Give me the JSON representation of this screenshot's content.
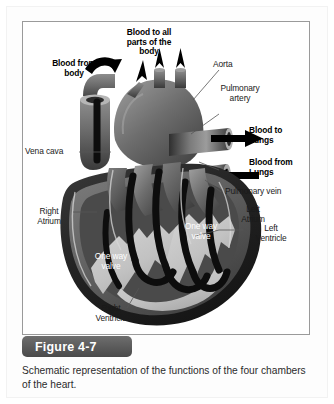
{
  "figure": {
    "number_label": "Figure 4-7",
    "caption": "Schematic representation of the functions of the four chambers of the heart.",
    "title": "Schematic representation of the functions of the four chambers of the heart."
  },
  "diagram": {
    "style": "grayscale shaded anatomical illustration",
    "colors": {
      "background": "#ffffff",
      "border": "#9a9a9a",
      "badge_fill": "#5a5a5a",
      "badge_text": "#ffffff",
      "caption_text": "#2b2b2b",
      "label_text": "#1a1a1a",
      "label_text_inverse": "#ffffff",
      "leader_line": "#555555",
      "heart_dark": "#3a3a3a",
      "heart_mid": "#6b6b6b",
      "heart_light": "#b9b9b9",
      "chamber_fill": "#c9c9c9",
      "flow_channel": "#0d0d0d",
      "arrow": "#000000"
    },
    "labels": [
      {
        "id": "blood-to-all-parts",
        "text": "Blood to all\nparts of the\nbody",
        "bold": true,
        "align": "center",
        "color": "dark"
      },
      {
        "id": "aorta",
        "text": "Aorta",
        "bold": false,
        "align": "left",
        "color": "dark"
      },
      {
        "id": "pulmonary-artery",
        "text": "Pulmonary\nartery",
        "bold": false,
        "align": "center",
        "color": "dark"
      },
      {
        "id": "blood-from-body",
        "text": "Blood from\nbody",
        "bold": true,
        "align": "center",
        "color": "dark"
      },
      {
        "id": "blood-to-lungs",
        "text": "Blood to\nLungs",
        "bold": true,
        "align": "left",
        "color": "dark"
      },
      {
        "id": "blood-from-lungs",
        "text": "Blood from\nLungs",
        "bold": true,
        "align": "left",
        "color": "dark"
      },
      {
        "id": "vena-cava",
        "text": "Vena cava",
        "bold": false,
        "align": "left",
        "color": "dark"
      },
      {
        "id": "pulmonary-vein",
        "text": "Pulmonary vein",
        "bold": false,
        "align": "left",
        "color": "dark"
      },
      {
        "id": "left-atrium",
        "text": "Left\nAtrium",
        "bold": false,
        "align": "center",
        "color": "dark"
      },
      {
        "id": "right-atrium",
        "text": "Right\nAtrium",
        "bold": false,
        "align": "center",
        "color": "dark"
      },
      {
        "id": "left-ventricle",
        "text": "Left\nVentricle",
        "bold": false,
        "align": "center",
        "color": "dark"
      },
      {
        "id": "right-ventricle",
        "text": "Right\nVentricle",
        "bold": false,
        "align": "center",
        "color": "dark"
      },
      {
        "id": "one-way-valve-upper",
        "text": "One way\nvalve",
        "bold": false,
        "align": "center",
        "color": "white"
      },
      {
        "id": "one-way-valve-lower",
        "text": "One way\nvalve",
        "bold": false,
        "align": "center",
        "color": "white"
      }
    ],
    "flow_arrows": [
      {
        "id": "arrow-to-body-1",
        "direction": "up",
        "meaning": "blood out to body"
      },
      {
        "id": "arrow-to-body-2",
        "direction": "up",
        "meaning": "blood out to body"
      },
      {
        "id": "arrow-to-body-3",
        "direction": "up",
        "meaning": "blood out to body"
      },
      {
        "id": "arrow-from-body",
        "direction": "down",
        "meaning": "blood in from body via vena cava"
      },
      {
        "id": "arrow-to-lungs",
        "direction": "right",
        "meaning": "blood out to lungs via pulmonary artery"
      },
      {
        "id": "arrow-from-lungs",
        "direction": "left",
        "meaning": "blood in from lungs via pulmonary vein"
      }
    ]
  }
}
